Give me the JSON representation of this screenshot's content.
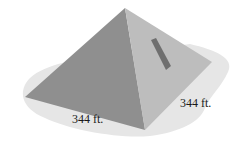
{
  "figure": {
    "labels": {
      "front_edge": "344 ft.",
      "right_edge": "344 ft."
    },
    "colors": {
      "ground_shadow": "#e6e6e6",
      "left_face": "#8f8f8f",
      "right_face": "#bdbdbd",
      "slot": "#6f6f6f",
      "text": "#1a1a1a"
    }
  }
}
